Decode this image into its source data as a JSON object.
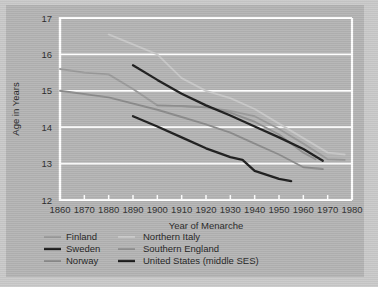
{
  "figure": {
    "background_color": "#b3b3b3",
    "outer_color": "#c9c9c9",
    "gridline_color": "#ffffff",
    "frame_color": "#ffffff"
  },
  "axes": {
    "y_title": "Age in Years",
    "x_title": "Year of Menarche",
    "y_ticks": [
      "12",
      "13",
      "14",
      "15",
      "16",
      "17"
    ],
    "x_ticks": [
      "1860",
      "1870",
      "1880",
      "1890",
      "1900",
      "1910",
      "1920",
      "1930",
      "1940",
      "1950",
      "1960",
      "1970",
      "1980"
    ]
  },
  "legend": {
    "entries": [
      {
        "label": "Finland",
        "color": "#9a9a9a",
        "width": 2.0,
        "column": "left"
      },
      {
        "label": "Sweden",
        "color": "#1c1c1c",
        "width": 2.4,
        "column": "left"
      },
      {
        "label": "Norway",
        "color": "#8a8a8a",
        "width": 2.0,
        "column": "left"
      },
      {
        "label": "Northern Italy",
        "color": "#c8c8c8",
        "width": 2.0,
        "column": "right"
      },
      {
        "label": "Southern England",
        "color": "#8f8f8f",
        "width": 2.0,
        "column": "right"
      },
      {
        "label": "United States (middle SES)",
        "color": "#1c1c1c",
        "width": 2.4,
        "column": "right"
      }
    ]
  },
  "chart_data": {
    "type": "line",
    "title": "",
    "xlabel": "Year of Menarche",
    "ylabel": "Age in Years",
    "xlim": [
      1860,
      1980
    ],
    "ylim": [
      12,
      17
    ],
    "grid": true,
    "legend_position": "below",
    "series": [
      {
        "name": "Northern Italy",
        "color": "#c8c8c8",
        "x": [
          1880,
          1900,
          1910,
          1920,
          1930,
          1940,
          1950,
          1960,
          1970,
          1977
        ],
        "y": [
          16.55,
          16.0,
          15.35,
          15.0,
          14.8,
          14.5,
          14.1,
          13.7,
          13.3,
          13.25
        ]
      },
      {
        "name": "Finland",
        "color": "#9a9a9a",
        "x": [
          1860,
          1870,
          1880,
          1890,
          1900,
          1910,
          1920,
          1930,
          1940,
          1950,
          1960,
          1970,
          1977
        ],
        "y": [
          15.6,
          15.5,
          15.45,
          15.05,
          14.6,
          14.58,
          14.55,
          14.45,
          14.3,
          13.95,
          13.55,
          13.12,
          13.1
        ]
      },
      {
        "name": "Norway",
        "color": "#8a8a8a",
        "x": [
          1860,
          1880,
          1900,
          1910,
          1920,
          1930,
          1940,
          1950,
          1960,
          1968
        ],
        "y": [
          15.0,
          14.82,
          14.48,
          14.28,
          14.08,
          13.85,
          13.55,
          13.25,
          12.9,
          12.85
        ]
      },
      {
        "name": "Sweden",
        "color": "#1c1c1c",
        "x": [
          1890,
          1900,
          1910,
          1920,
          1930,
          1940,
          1950,
          1960,
          1968
        ],
        "y": [
          15.7,
          15.3,
          14.92,
          14.6,
          14.32,
          14.02,
          13.72,
          13.4,
          13.08
        ]
      },
      {
        "name": "Southern England",
        "color": "#8f8f8f",
        "x": [
          1900,
          1910,
          1920,
          1930,
          1940,
          1950,
          1960,
          1965
        ],
        "y": [
          14.6,
          14.58,
          14.55,
          14.4,
          14.15,
          13.8,
          13.3,
          13.12
        ]
      },
      {
        "name": "United States (middle SES)",
        "color": "#1c1c1c",
        "x": [
          1890,
          1900,
          1910,
          1920,
          1930,
          1935,
          1940,
          1950,
          1955
        ],
        "y": [
          14.3,
          14.02,
          13.72,
          13.42,
          13.18,
          13.1,
          12.8,
          12.58,
          12.52
        ]
      }
    ]
  }
}
